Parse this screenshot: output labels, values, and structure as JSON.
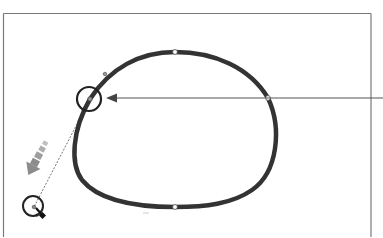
{
  "diagram": {
    "colors": {
      "background": "#ffffff",
      "frame": "#7a7a7a",
      "path": "#333333",
      "anchor_fill": "#ffffff",
      "callout_arrow": "#555555",
      "drag_arrow": "#8c8c8c",
      "handle_line": "#777777",
      "highlight_circle": "#222222"
    },
    "frame": {
      "left": 3,
      "top": 13,
      "right": 371
    },
    "path": {
      "type": "closed-bezier",
      "anchors": [
        {
          "name": "top",
          "x": 175,
          "y": 52
        },
        {
          "name": "right",
          "x": 268,
          "y": 98
        },
        {
          "name": "bottom",
          "x": 175,
          "y": 207
        },
        {
          "name": "left-selected",
          "x": 90,
          "y": 99
        }
      ],
      "secondary_handle": {
        "x": 105,
        "y": 74
      }
    },
    "callout": {
      "from": {
        "x": 383,
        "y": 98
      },
      "to": {
        "x": 106,
        "y": 98
      },
      "target": "left-selected anchor"
    },
    "drag": {
      "direction": "down-left",
      "handle_end": {
        "x": 34,
        "y": 207
      },
      "cursor": "direct-selection"
    }
  }
}
